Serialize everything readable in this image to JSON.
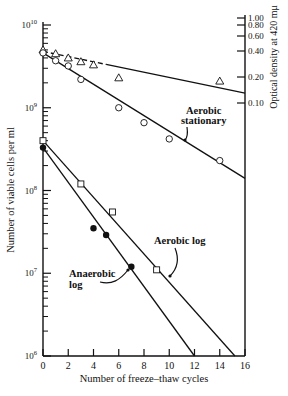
{
  "chart_data": {
    "type": "scatter",
    "title": "",
    "xlabel": "Number of freeze–thaw cycles",
    "ylabel": "Number of viable cells per ml",
    "y2label": "Optical density at 420 mμ",
    "yscale": "log",
    "xlim": [
      0,
      16
    ],
    "ylim": [
      1000000,
      10000000000
    ],
    "x_ticks": [
      "0",
      "2",
      "4",
      "6",
      "8",
      "10",
      "12",
      "14",
      "16"
    ],
    "y_ticks": [
      "10^6",
      "10^7",
      "10^8",
      "10^9",
      "10^10"
    ],
    "y_tick_labels": [
      {
        "base": "10",
        "exp": "6"
      },
      {
        "base": "10",
        "exp": "7"
      },
      {
        "base": "10",
        "exp": "8"
      },
      {
        "base": "10",
        "exp": "9"
      },
      {
        "base": "10",
        "exp": "10"
      }
    ],
    "y2_ticks": [
      "1.00",
      "0.80",
      "0.60",
      "0.40",
      "0.20",
      "0.10"
    ],
    "grid": false,
    "series": [
      {
        "name": "Optical density (triangles)",
        "marker": "open-triangle",
        "x": [
          0,
          1,
          2,
          3,
          4,
          6,
          14
        ],
        "y": [
          5000000000,
          4500000000,
          4000000000,
          3600000000,
          3300000000,
          2300000000,
          2100000000
        ],
        "fit": {
          "x": [
            0,
            16
          ],
          "y": [
            4800000000,
            1500000000
          ],
          "dashed_until": 5
        }
      },
      {
        "name": "Aerobic stationary",
        "marker": "open-circle",
        "x": [
          0,
          1,
          2,
          3,
          6,
          8,
          10,
          14
        ],
        "y": [
          4600000000,
          3700000000,
          3200000000,
          2200000000,
          1000000000,
          660000000,
          420000000,
          230000000
        ],
        "fit": {
          "x": [
            0,
            16
          ],
          "y": [
            4600000000,
            140000000
          ]
        }
      },
      {
        "name": "Aerobic log",
        "marker": "open-square",
        "x": [
          0,
          3,
          5.5,
          9
        ],
        "y": [
          400000000,
          120000000,
          55000000,
          11000000
        ],
        "fit": {
          "x": [
            0,
            15.2
          ],
          "y": [
            400000000,
            1000000
          ]
        }
      },
      {
        "name": "Anaerobic log",
        "marker": "filled-circle",
        "x": [
          0,
          4,
          5,
          7
        ],
        "y": [
          330000000,
          35000000,
          29000000,
          12000000
        ],
        "fit": {
          "x": [
            0,
            12
          ],
          "y": [
            330000000,
            1000000
          ]
        }
      }
    ],
    "annotations": [
      "Aerobic stationary",
      "Aerobic log",
      "Anaerobic log"
    ]
  },
  "labels": {
    "xlabel": "Number of freeze–thaw cycles",
    "ylabel": "Number of viable cells per ml",
    "y2label": "Optical density at 420 mμ",
    "aerobic_stationary_1": "Aerobic",
    "aerobic_stationary_2": "stationary",
    "aerobic_log": "Aerobic log",
    "anaerobic_log_1": "Anaerobic",
    "anaerobic_log_2": "log"
  }
}
